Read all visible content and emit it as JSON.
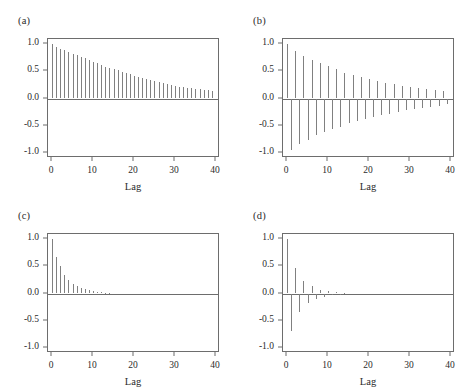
{
  "figure": {
    "panel_count": 4,
    "width": 470,
    "height": 389,
    "line_color": "#808080",
    "axis_color": "#6d6d6d",
    "text_color": "#2b2b2b",
    "background": "#ffffff"
  },
  "chart_data": [
    {
      "type": "bar",
      "title": "(a)",
      "xlabel": "Lag",
      "ylabel": "",
      "xlim": [
        -1,
        41
      ],
      "ylim": [
        -1.1,
        1.1
      ],
      "xticks": [
        0,
        10,
        20,
        30,
        40
      ],
      "xticklabels": [
        "0",
        "10",
        "20",
        "30",
        "40"
      ],
      "yticks": [
        1.0,
        0.5,
        0.0,
        -0.5,
        -1.0
      ],
      "yticklabels": [
        "1.0",
        "0.5",
        "0.0",
        "-0.5",
        "-1.0"
      ],
      "grid": false,
      "legend": "none",
      "x": [
        0,
        1,
        2,
        3,
        4,
        5,
        6,
        7,
        8,
        9,
        10,
        11,
        12,
        13,
        14,
        15,
        16,
        17,
        18,
        19,
        20,
        21,
        22,
        23,
        24,
        25,
        26,
        27,
        28,
        29,
        30,
        31,
        32,
        33,
        34,
        35,
        36,
        37,
        38,
        39
      ],
      "values": [
        1.0,
        0.96,
        0.92,
        0.89,
        0.86,
        0.83,
        0.8,
        0.77,
        0.74,
        0.71,
        0.68,
        0.65,
        0.62,
        0.59,
        0.57,
        0.54,
        0.52,
        0.49,
        0.47,
        0.45,
        0.42,
        0.4,
        0.38,
        0.36,
        0.34,
        0.32,
        0.3,
        0.28,
        0.26,
        0.25,
        0.23,
        0.22,
        0.21,
        0.2,
        0.19,
        0.18,
        0.17,
        0.16,
        0.15,
        0.13
      ]
    },
    {
      "type": "bar",
      "title": "(b)",
      "xlabel": "Lag",
      "ylabel": "",
      "xlim": [
        -1,
        41
      ],
      "ylim": [
        -1.1,
        1.1
      ],
      "xticks": [
        0,
        10,
        20,
        30,
        40
      ],
      "xticklabels": [
        "0",
        "10",
        "20",
        "30",
        "40"
      ],
      "yticks": [
        1.0,
        0.5,
        0.0,
        -0.5,
        -1.0
      ],
      "yticklabels": [
        "1.0",
        "0.5",
        "0.0",
        "-0.5",
        "-1.0"
      ],
      "grid": false,
      "legend": "none",
      "x": [
        0,
        1,
        2,
        3,
        4,
        5,
        6,
        7,
        8,
        9,
        10,
        11,
        12,
        13,
        14,
        15,
        16,
        17,
        18,
        19,
        20,
        21,
        22,
        23,
        24,
        25,
        26,
        27,
        28,
        29,
        30,
        31,
        32,
        33,
        34,
        35,
        36,
        37,
        38,
        39
      ],
      "values": [
        1.0,
        -0.95,
        0.88,
        -0.85,
        0.79,
        -0.76,
        0.71,
        -0.68,
        0.65,
        -0.62,
        0.6,
        -0.57,
        0.54,
        -0.52,
        0.48,
        -0.46,
        0.44,
        -0.42,
        0.4,
        -0.38,
        0.36,
        -0.34,
        0.33,
        -0.31,
        0.29,
        -0.28,
        0.26,
        -0.25,
        0.23,
        -0.22,
        0.21,
        -0.2,
        0.19,
        -0.18,
        0.17,
        -0.16,
        0.15,
        -0.14,
        0.13,
        -0.11
      ]
    },
    {
      "type": "bar",
      "title": "(c)",
      "xlabel": "Lag",
      "ylabel": "",
      "xlim": [
        -1,
        41
      ],
      "ylim": [
        -1.1,
        1.1
      ],
      "xticks": [
        0,
        10,
        20,
        30,
        40
      ],
      "xticklabels": [
        "0",
        "10",
        "20",
        "30",
        "40"
      ],
      "yticks": [
        1.0,
        0.5,
        0.0,
        -0.5,
        -1.0
      ],
      "yticklabels": [
        "1.0",
        "0.5",
        "0.0",
        "-0.5",
        "-1.0"
      ],
      "grid": false,
      "legend": "none",
      "x": [
        0,
        1,
        2,
        3,
        4,
        5,
        6,
        7,
        8,
        9,
        10,
        11,
        12,
        13,
        14,
        15,
        16,
        17,
        18,
        19,
        20,
        21,
        22,
        23,
        24,
        25,
        26,
        27,
        28,
        29,
        30,
        31,
        32,
        33,
        34,
        35,
        36,
        37,
        38,
        39
      ],
      "values": [
        1.0,
        0.68,
        0.5,
        0.35,
        0.25,
        0.18,
        0.13,
        0.1,
        0.08,
        0.06,
        0.05,
        0.03,
        0.02,
        0.01,
        0.01,
        0.0,
        0.0,
        0.0,
        0.0,
        0.0,
        0.0,
        0.0,
        0.0,
        0.0,
        0.0,
        0.0,
        0.0,
        0.0,
        0.0,
        0.0,
        0.0,
        0.0,
        0.0,
        0.0,
        0.0,
        0.0,
        0.0,
        0.0,
        0.0,
        0.0
      ]
    },
    {
      "type": "bar",
      "title": "(d)",
      "xlabel": "Lag",
      "ylabel": "",
      "xlim": [
        -1,
        41
      ],
      "ylim": [
        -1.1,
        1.1
      ],
      "xticks": [
        0,
        10,
        20,
        30,
        40
      ],
      "xticklabels": [
        "0",
        "10",
        "20",
        "30",
        "40"
      ],
      "yticks": [
        1.0,
        0.5,
        0.0,
        -0.5,
        -1.0
      ],
      "yticklabels": [
        "1.0",
        "0.5",
        "0.0",
        "-0.5",
        "-1.0"
      ],
      "grid": false,
      "legend": "none",
      "x": [
        0,
        1,
        2,
        3,
        4,
        5,
        6,
        7,
        8,
        9,
        10,
        11,
        12,
        13,
        14,
        15,
        16,
        17,
        18,
        19,
        20,
        21,
        22,
        23,
        24,
        25,
        26,
        27,
        28,
        29,
        30,
        31,
        32,
        33,
        34,
        35,
        36,
        37,
        38,
        39
      ],
      "values": [
        1.0,
        -0.7,
        0.47,
        -0.35,
        0.24,
        -0.18,
        0.13,
        -0.1,
        0.07,
        -0.06,
        0.04,
        -0.03,
        0.02,
        -0.01,
        0.01,
        0.0,
        0.0,
        0.0,
        0.0,
        0.0,
        0.0,
        0.0,
        0.0,
        0.0,
        0.0,
        0.0,
        0.0,
        0.0,
        0.0,
        0.0,
        0.0,
        0.0,
        0.0,
        0.0,
        0.0,
        0.0,
        0.0,
        0.0,
        0.0,
        0.0
      ]
    }
  ]
}
